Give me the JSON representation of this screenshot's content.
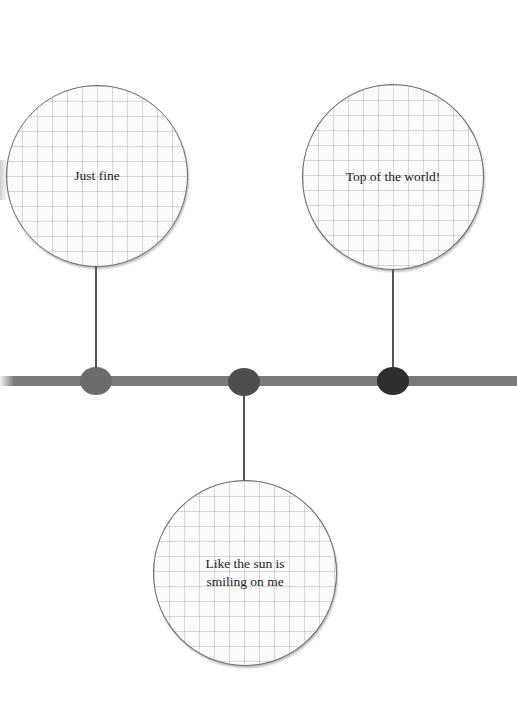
{
  "diagram": {
    "type": "timeline",
    "colors": {
      "line": "#7a7a7a",
      "connector": "#555555",
      "dot_1": "#6b6b6b",
      "dot_2": "#4e4e4e",
      "dot_3": "#2f2f2f",
      "bubble_border": "#6a6a6a",
      "grid": "#c8c8c8"
    },
    "events": [
      {
        "label": "Just fine",
        "position": "above"
      },
      {
        "label": "Like the sun is smiling on me",
        "position": "below"
      },
      {
        "label": "Top of the world!",
        "position": "above"
      }
    ]
  }
}
